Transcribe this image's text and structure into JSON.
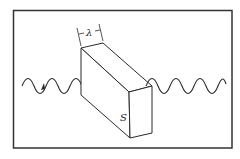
{
  "diagram": {
    "labels": {
      "width_label": "λ",
      "slab_label": "S"
    },
    "colors": {
      "line": "#2a2a2a",
      "frame": "#333333",
      "background": "#ffffff"
    },
    "elements": {
      "incoming_wave": "sinusoidal wave from left with arrow",
      "slab": "rectangular box S",
      "outgoing_wave": "sinusoidal wave to the right"
    }
  }
}
